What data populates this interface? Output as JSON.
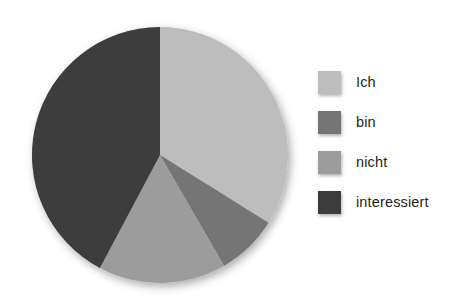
{
  "chart_data": {
    "type": "pie",
    "title": "",
    "subtitle": "",
    "xlabel": "",
    "ylabel": "",
    "grid": false,
    "legend_position": "right",
    "start_angle_deg": 0,
    "direction": "clockwise",
    "categories": [
      "Ich",
      "bin",
      "nicht",
      "interessiert"
    ],
    "values": [
      34,
      8,
      16,
      42
    ],
    "units": "percent",
    "slices": [
      {
        "label": "Ich",
        "value": 34,
        "color": "#bdbdbd",
        "start_deg": 0,
        "end_deg": 122
      },
      {
        "label": "bin",
        "value": 8,
        "color": "#757575",
        "start_deg": 122,
        "end_deg": 150
      },
      {
        "label": "nicht",
        "value": 16,
        "color": "#9c9c9c",
        "start_deg": 150,
        "end_deg": 208
      },
      {
        "label": "interessiert",
        "value": 42,
        "color": "#3c3c3c",
        "start_deg": 208,
        "end_deg": 360
      }
    ],
    "annotations": []
  },
  "legend": {
    "items": [
      {
        "label": "Ich",
        "color": "#bdbdbd"
      },
      {
        "label": "bin",
        "color": "#757575"
      },
      {
        "label": "nicht",
        "color": "#9c9c9c"
      },
      {
        "label": "interessiert",
        "color": "#3c3c3c"
      }
    ]
  },
  "colors": {
    "background": "#ffffff",
    "text": "#231f20",
    "slice_ich": "#bdbdbd",
    "slice_bin": "#757575",
    "slice_nicht": "#9c9c9c",
    "slice_interessiert": "#3c3c3c"
  }
}
